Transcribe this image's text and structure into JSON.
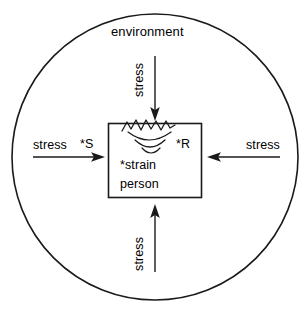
{
  "diagram": {
    "type": "stress-strain-person-environment-model",
    "colors": {
      "stroke": "#1a1a1a",
      "background": "#ffffff",
      "text": "#000000"
    },
    "outer_boundary": {
      "shape": "circle",
      "label": "environment"
    },
    "inner_boundary": {
      "shape": "rectangle",
      "labels": {
        "strain": "*strain",
        "person": "person"
      }
    },
    "annotations": {
      "stimulus": "*S",
      "response": "*R"
    },
    "arrows": [
      {
        "id": "stress-top",
        "label": "stress",
        "direction": "down",
        "orientation": "vertical"
      },
      {
        "id": "stress-bottom",
        "label": "stress",
        "direction": "up",
        "orientation": "vertical"
      },
      {
        "id": "stress-left",
        "label": "stress",
        "direction": "right",
        "orientation": "horizontal"
      },
      {
        "id": "stress-right",
        "label": "stress",
        "direction": "left",
        "orientation": "horizontal"
      }
    ],
    "impact_glyph": {
      "name": "zigzag-ripple",
      "description": "jagged break line with three concentric arcs below"
    }
  }
}
